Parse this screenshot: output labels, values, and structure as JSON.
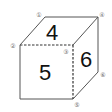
{
  "diagram": {
    "type": "cube",
    "faces": [
      {
        "position": "top",
        "number": "4"
      },
      {
        "position": "front",
        "number": "5"
      },
      {
        "position": "right",
        "number": "6"
      }
    ],
    "corners": [
      {
        "label": "1",
        "glyph": "①"
      },
      {
        "label": "2",
        "glyph": "②"
      },
      {
        "label": "3",
        "glyph": "③"
      },
      {
        "label": "4",
        "glyph": "④"
      },
      {
        "label": "5",
        "glyph": "⑤"
      },
      {
        "label": "6",
        "glyph": "⑥"
      }
    ],
    "dashed_edges": [
      "2-3",
      "3-5"
    ]
  }
}
